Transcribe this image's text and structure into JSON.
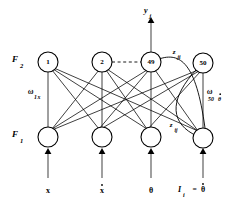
{
  "figure": {
    "type": "neural-network-architecture-diagram"
  },
  "layers": {
    "f2": {
      "label_main": "F",
      "label_sub": "2",
      "nodes": [
        {
          "id": "f2-node-1",
          "label": "1",
          "cx": 48,
          "cy": 62
        },
        {
          "id": "f2-node-2",
          "label": "2",
          "cx": 102,
          "cy": 62
        },
        {
          "id": "f2-node-49",
          "label": "49",
          "cx": 151,
          "cy": 62
        },
        {
          "id": "f2-node-50",
          "label": "50",
          "cx": 203,
          "cy": 63
        }
      ]
    },
    "f1": {
      "label_main": "F",
      "label_sub": "1",
      "nodes": [
        {
          "id": "f1-node-1",
          "label": "",
          "cx": 48,
          "cy": 137
        },
        {
          "id": "f1-node-2",
          "label": "",
          "cx": 102,
          "cy": 137
        },
        {
          "id": "f1-node-3",
          "label": "",
          "cx": 151,
          "cy": 137
        },
        {
          "id": "f1-node-4",
          "label": "",
          "cx": 203,
          "cy": 138
        }
      ]
    }
  },
  "output": {
    "label_main": "y",
    "label_sub": "j"
  },
  "weights": {
    "left": {
      "symbol": "ω",
      "sub_main": "1",
      "sub_italic": "x"
    },
    "right": {
      "symbol": "ω",
      "sub_main": "50",
      "sub_theta": "θ",
      "dot": "̇"
    }
  },
  "arcs": {
    "top": {
      "label_main": "z",
      "label_sub": "ji"
    },
    "bottom": {
      "label_main": "z",
      "label_sub": "ij"
    }
  },
  "inputs": [
    {
      "id": "input-x",
      "label": "x",
      "dot": false,
      "cx": 48
    },
    {
      "id": "input-xdot",
      "label": "x",
      "dot": true,
      "cx": 102
    },
    {
      "id": "input-theta",
      "label": "θ",
      "dot": false,
      "cx": 151
    },
    {
      "id": "input-thetadot",
      "label": "I",
      "sub": "i",
      "eq": "=",
      "theta": "θ",
      "dot": true,
      "cx": 203
    }
  ],
  "colors": {
    "stroke": "#000000",
    "background": "#ffffff",
    "axis_line": "#606060"
  }
}
